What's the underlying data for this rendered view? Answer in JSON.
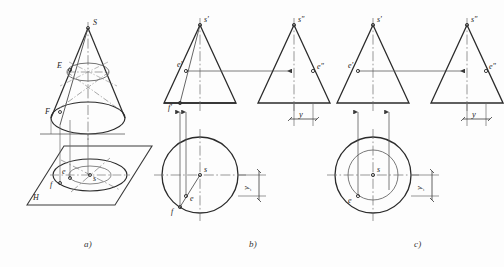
{
  "figure": {
    "panels": [
      {
        "id": "a",
        "caption": "a)",
        "description": "Pictorial (axonometric) view of a cone standing on the horizontal projection plane H",
        "labels": {
          "apex": "S",
          "point_e_space": "E",
          "point_f_space": "F",
          "plane": "H",
          "point_e_plan": "e",
          "point_s_plan": "s",
          "point_f_plan": "f"
        }
      },
      {
        "id": "b",
        "caption": "b)",
        "description": "Three-view projection solved with the auxiliary straight line (generatrix) method",
        "labels": {
          "front_apex": "s'",
          "front_point_e": "e'",
          "front_point_f": "f'",
          "side_apex": "s\"",
          "side_point_e": "e\"",
          "top_center": "s",
          "top_point_e": "e",
          "top_point_f": "f",
          "dimension_side": "y",
          "dimension_top": "y"
        }
      },
      {
        "id": "c",
        "caption": "c)",
        "description": "Three-view projection solved with the auxiliary parallel circle method",
        "labels": {
          "front_apex": "s'",
          "front_point_e": "e'",
          "side_apex": "s\"",
          "side_point_e": "e\"",
          "top_center": "s",
          "top_point_e": "e",
          "dimension_side": "y",
          "dimension_top": "y"
        }
      }
    ],
    "colors": {
      "outline": "#2b2b2b",
      "thin": "#5b5b5b",
      "centerline": "#6a6a6a",
      "background": "#fdfdfd"
    }
  }
}
